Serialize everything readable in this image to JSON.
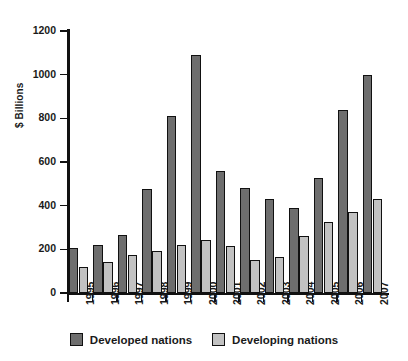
{
  "chart_data": {
    "type": "bar",
    "title": "",
    "xlabel": "",
    "ylabel": "$ Billions",
    "categories": [
      "1995",
      "1996",
      "1997",
      "1998",
      "1999",
      "2000",
      "2001",
      "2002",
      "2003",
      "2004",
      "2005",
      "2006",
      "2007"
    ],
    "series": [
      {
        "name": "Developed nations",
        "color": "#6e6e6e",
        "values": [
          205,
          218,
          268,
          475,
          812,
          1090,
          560,
          480,
          430,
          388,
          528,
          840,
          1000
        ]
      },
      {
        "name": "Developing nations",
        "color": "#c2c2c2",
        "values": [
          118,
          140,
          175,
          193,
          222,
          245,
          215,
          152,
          165,
          262,
          325,
          370,
          432
        ]
      }
    ],
    "ylim": [
      0,
      1200
    ],
    "yticks": [
      0,
      200,
      400,
      600,
      800,
      1000,
      1200
    ],
    "ytick_labels": [
      "0",
      "200",
      "400",
      "600",
      "800",
      "1000",
      "1200"
    ],
    "grid": false,
    "legend_position": "bottom"
  }
}
